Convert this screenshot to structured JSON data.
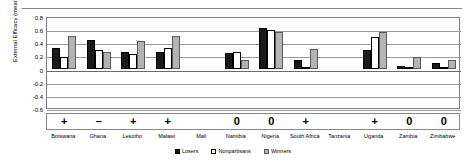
{
  "chart_data": {
    "type": "bar",
    "title": "",
    "xlabel": "",
    "ylabel": "External Efficacy (mean)",
    "ylim": [
      -0.6,
      0.8
    ],
    "yticks": [
      "0.8",
      "0.6",
      "0.4",
      "0.2",
      "0",
      "-0.2",
      "-0.4",
      "-0.6"
    ],
    "grid": true,
    "legend_position": "bottom",
    "categories": [
      "Botswana",
      "Ghana",
      "Lesotho",
      "Malawi",
      "Mali",
      "Namibia",
      "Nigeria",
      "South Africa",
      "Tanzania",
      "Uganda",
      "Zambia",
      "Zimbabwe"
    ],
    "signs": [
      "+",
      "–",
      "+",
      "+",
      "",
      "0",
      "0",
      "+",
      "",
      "+",
      "0",
      "0"
    ],
    "series": [
      {
        "name": "Losers",
        "color": "#1a1a1a",
        "values": [
          0.32,
          0.43,
          0.25,
          0.26,
          null,
          0.23,
          0.62,
          0.13,
          null,
          0.28,
          0.04,
          0.08
        ]
      },
      {
        "name": "Nonpartisans",
        "color": "#ffffff",
        "values": [
          0.18,
          0.29,
          0.22,
          0.31,
          null,
          0.26,
          0.59,
          0.02,
          null,
          0.48,
          0.01,
          0.01
        ]
      },
      {
        "name": "Winners",
        "color": "#b3b3b3",
        "values": [
          0.5,
          0.25,
          0.42,
          0.5,
          null,
          0.13,
          0.55,
          0.3,
          null,
          0.55,
          0.17,
          0.13
        ]
      }
    ]
  }
}
